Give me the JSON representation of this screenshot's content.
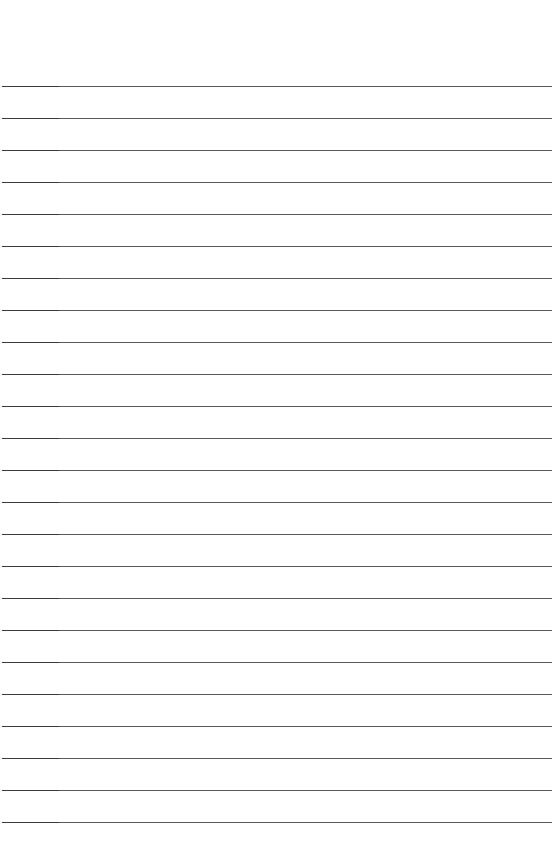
{
  "page": {
    "type": "lined-paper",
    "background_color": "#ffffff",
    "line_color": "#5a5a5a",
    "first_line_y": 86,
    "line_spacing": 32,
    "line_count": 24
  }
}
